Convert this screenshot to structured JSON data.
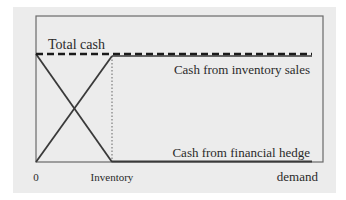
{
  "diagram": {
    "labels": {
      "total_cash": "Total cash",
      "inventory_sales": "Cash from inventory sales",
      "financial_hedge": "Cash from financial hedge",
      "origin": "0",
      "inventory": "Inventory",
      "demand": "demand"
    },
    "colors": {
      "background_panel": "#ececec",
      "box_border": "#6a6a6a",
      "line": "#3a3a3a",
      "text": "#2a2a2a"
    }
  }
}
